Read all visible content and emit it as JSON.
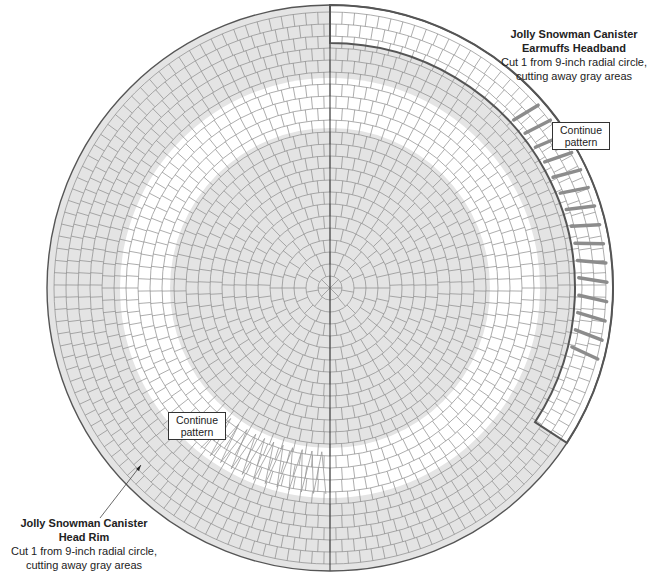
{
  "diagram": {
    "center": [
      330,
      288
    ],
    "radii": {
      "outer": 283,
      "headband_inner": 245,
      "white_band_outer": 210,
      "inner_disk": 160
    },
    "grid": {
      "cell_size": 12
    },
    "colors": {
      "gray_fill": "#e4e4e4",
      "white_fill": "#ffffff",
      "grid_line": "#8a8a8a",
      "cut_line": "#555555",
      "dart_fill": "#8c8c8c"
    }
  },
  "pieces": {
    "headband": {
      "title_line1": "Jolly Snowman Canister",
      "title_line2": "Earmuffs Headband",
      "desc_line1": "Cut 1 from 9-inch radial circle,",
      "desc_line2": "cutting away gray areas",
      "callout_line1": "Continue",
      "callout_line2": "pattern"
    },
    "rim": {
      "title_line1": "Jolly Snowman Canister",
      "title_line2": "Head Rim",
      "desc_line1": "Cut 1 from 9-inch radial circle,",
      "desc_line2": "cutting away gray areas",
      "callout_line1": "Continue",
      "callout_line2": "pattern"
    }
  }
}
